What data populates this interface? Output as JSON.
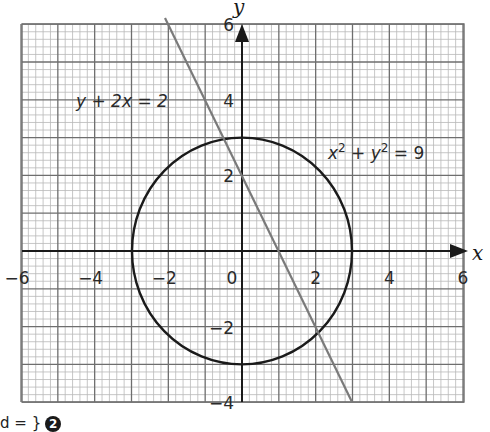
{
  "chart_data": {
    "type": "line",
    "title": "",
    "xlabel": "x",
    "ylabel": "y",
    "xlim": [
      -6,
      6
    ],
    "ylim": [
      -4,
      6
    ],
    "grid": true,
    "grid_minor_subdivisions": 5,
    "x_ticks": [
      -6,
      -4,
      -2,
      0,
      2,
      4,
      6
    ],
    "y_ticks": [
      -4,
      -2,
      2,
      4,
      6
    ],
    "x_tick_labels": [
      "−6",
      "−4",
      "−2",
      "0",
      "2",
      "4",
      "6"
    ],
    "y_tick_labels": [
      "−4",
      "−2",
      "2",
      "4",
      "6"
    ],
    "series": [
      {
        "name": "y + 2x = 2",
        "kind": "line",
        "equation": "y = 2 - 2x",
        "x": [
          -2.1,
          3.0
        ],
        "y": [
          6.2,
          -4.0
        ],
        "color": "#7a7a7a"
      },
      {
        "name": "x² + y² = 9",
        "kind": "circle",
        "center": [
          0,
          0
        ],
        "radius": 3,
        "color": "#1a1a1a"
      }
    ],
    "intersections": [
      [
        -0.2,
        2.4
      ],
      [
        1.8,
        -1.6
      ]
    ],
    "annotations": [
      {
        "text": "y + 2x = 2",
        "x": -4.4,
        "y": 3.9
      },
      {
        "text": "x² + y² = 9",
        "x": 2.3,
        "y": 2.4
      }
    ]
  },
  "labels": {
    "x_axis": "x",
    "y_axis": "y",
    "line_eq": {
      "lhs": "y + 2x = 2"
    },
    "circle_eq": {
      "x": "x",
      "xsup": "2",
      "plus": " + ",
      "y": "y",
      "ysup": "2",
      "rhs": " = 9"
    },
    "footer_text": "d = }",
    "footer_badge": "2"
  },
  "colors": {
    "minor_grid": "#b9b9b9",
    "major_grid": "#6e6e6e",
    "axis": "#1a1a1a",
    "line": "#7a7a7a",
    "circle": "#1a1a1a"
  }
}
